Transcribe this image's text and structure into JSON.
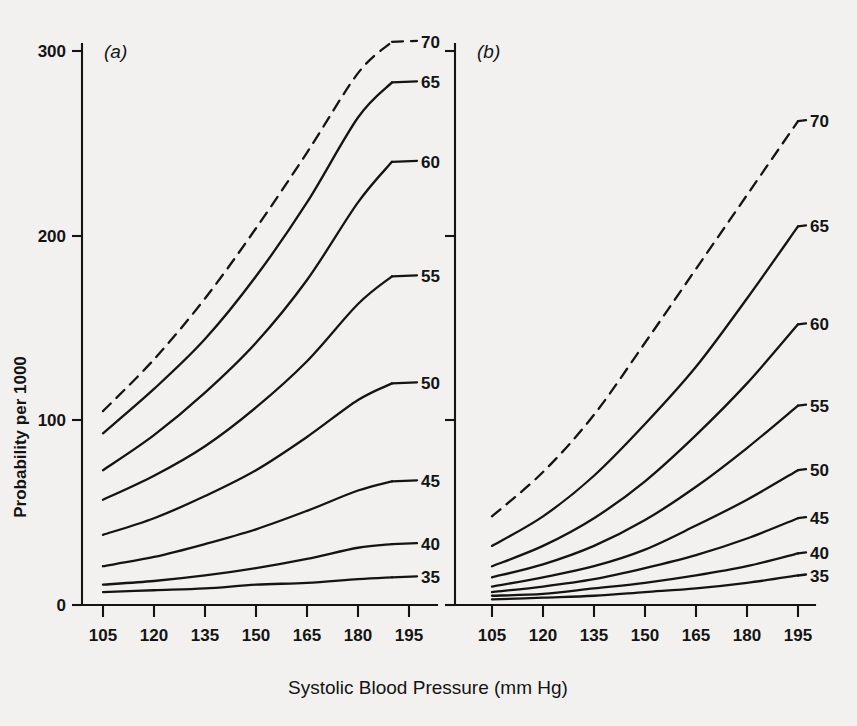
{
  "figure": {
    "background_color": "#f2f1ef",
    "ink_color": "#141414",
    "x_axis_title": "Systolic Blood Pressure (mm Hg)",
    "y_axis_title": "Probability per 1000",
    "panels": [
      {
        "tag": "(a)"
      },
      {
        "tag": "(b)"
      }
    ]
  },
  "chart_data": [
    {
      "type": "line",
      "panel": "(a)",
      "title": "(a)",
      "xlabel": "Systolic Blood Pressure (mm Hg)",
      "ylabel": "Probability per 1000",
      "xlim": [
        100,
        200
      ],
      "ylim": [
        0,
        315
      ],
      "xticks": [
        105,
        120,
        135,
        150,
        165,
        180,
        195
      ],
      "yticks": [
        0,
        100,
        200,
        300
      ],
      "grid": false,
      "legend": "curve-end labels (age in years)",
      "x": [
        105,
        120,
        135,
        150,
        165,
        180,
        190
      ],
      "series": [
        {
          "name": "70",
          "style": "dashed",
          "label": "70",
          "values": [
            105,
            133,
            166,
            204,
            245,
            288,
            305
          ]
        },
        {
          "name": "65",
          "style": "solid",
          "label": "65",
          "values": [
            93,
            117,
            144,
            178,
            218,
            264,
            283
          ]
        },
        {
          "name": "60",
          "style": "solid",
          "label": "60",
          "values": [
            73,
            92,
            115,
            142,
            176,
            218,
            240
          ]
        },
        {
          "name": "55",
          "style": "solid",
          "label": "55",
          "values": [
            57,
            70,
            86,
            107,
            132,
            163,
            178
          ]
        },
        {
          "name": "50",
          "style": "solid",
          "label": "50",
          "values": [
            38,
            47,
            59,
            73,
            91,
            111,
            120
          ]
        },
        {
          "name": "45",
          "style": "solid",
          "label": "45",
          "values": [
            21,
            26,
            33,
            41,
            51,
            62,
            67
          ]
        },
        {
          "name": "40",
          "style": "solid",
          "label": "40",
          "values": [
            11,
            13,
            16,
            20,
            25,
            31,
            33
          ]
        },
        {
          "name": "35",
          "style": "solid",
          "label": "35",
          "values": [
            7,
            8,
            9,
            11,
            12,
            14,
            15
          ]
        }
      ]
    },
    {
      "type": "line",
      "panel": "(b)",
      "title": "(b)",
      "xlabel": "Systolic Blood Pressure (mm Hg)",
      "ylabel": "Probability per 1000",
      "xlim": [
        100,
        200
      ],
      "ylim": [
        0,
        315
      ],
      "xticks": [
        105,
        120,
        135,
        150,
        165,
        180,
        195
      ],
      "yticks": [
        0,
        100,
        200,
        300
      ],
      "grid": false,
      "legend": "curve-end labels (age in years)",
      "x": [
        105,
        120,
        135,
        150,
        165,
        180,
        195
      ],
      "series": [
        {
          "name": "70",
          "style": "dashed",
          "label": "70",
          "values": [
            48,
            72,
            103,
            142,
            182,
            222,
            262
          ]
        },
        {
          "name": "65",
          "style": "solid",
          "label": "65",
          "values": [
            32,
            48,
            70,
            98,
            129,
            166,
            205
          ]
        },
        {
          "name": "60",
          "style": "solid",
          "label": "60",
          "values": [
            21,
            32,
            47,
            67,
            92,
            120,
            152
          ]
        },
        {
          "name": "55",
          "style": "solid",
          "label": "55",
          "values": [
            15,
            22,
            32,
            46,
            64,
            85,
            108
          ]
        },
        {
          "name": "50",
          "style": "solid",
          "label": "50",
          "values": [
            10,
            15,
            21,
            30,
            43,
            57,
            73
          ]
        },
        {
          "name": "45",
          "style": "solid",
          "label": "45",
          "values": [
            7,
            10,
            14,
            20,
            27,
            36,
            47
          ]
        },
        {
          "name": "40",
          "style": "solid",
          "label": "40",
          "values": [
            5,
            6,
            9,
            12,
            16,
            21,
            28
          ]
        },
        {
          "name": "35",
          "style": "solid",
          "label": "35",
          "values": [
            3,
            4,
            5,
            7,
            9,
            12,
            16
          ]
        }
      ]
    }
  ],
  "axes": {
    "y_tick_labels": [
      "300",
      "200",
      "100",
      "0"
    ],
    "x_tick_labels_a": [
      "105",
      "120",
      "135",
      "150",
      "165",
      "180",
      "195"
    ],
    "x_tick_labels_b": [
      "105",
      "120",
      "135",
      "150",
      "165",
      "180",
      "195"
    ]
  },
  "curve_labels_a": [
    "70",
    "65",
    "60",
    "55",
    "50",
    "45",
    "40",
    "35"
  ],
  "curve_labels_b": [
    "70",
    "65",
    "60",
    "55",
    "50",
    "45",
    "40",
    "35"
  ]
}
